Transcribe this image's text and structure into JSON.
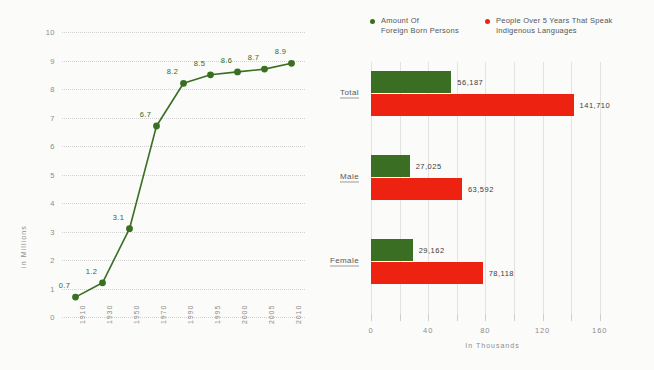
{
  "colors": {
    "green": "#3a6f23",
    "red": "#ee2211",
    "grid": "#d2d2d2",
    "text": "#8b8b8d"
  },
  "chart_data": [
    {
      "type": "line",
      "name": "foreign-born-line-chart",
      "title": "",
      "xlabel": "",
      "ylabel": "in Millions",
      "ylim": [
        0,
        10
      ],
      "yticks": [
        "0",
        "1",
        "2",
        "3",
        "4",
        "5",
        "6",
        "7",
        "8",
        "9",
        "10"
      ],
      "grid": true,
      "categories": [
        "1910",
        "1930",
        "1950",
        "1970",
        "1990",
        "1995",
        "2000",
        "2005",
        "2010"
      ],
      "values": [
        0.7,
        1.2,
        3.1,
        6.7,
        8.2,
        8.5,
        8.6,
        8.7,
        8.9
      ],
      "point_labels": [
        "0.7",
        "1.2",
        "3.1",
        "6.7",
        "8.2",
        "8.5",
        "8.6",
        "8.7",
        "8.9"
      ],
      "series_color": "#3a6f23"
    },
    {
      "type": "bar",
      "name": "population-bar-chart",
      "orientation": "horizontal",
      "xlabel": "In Thousands",
      "ylabel": "",
      "xlim": [
        0,
        170
      ],
      "xticks": [
        0,
        20,
        40,
        60,
        80,
        100,
        120,
        140,
        160
      ],
      "xtick_labels": [
        {
          "value": 0,
          "label": "0"
        },
        {
          "value": 40,
          "label": "40"
        },
        {
          "value": 80,
          "label": "80"
        },
        {
          "value": 120,
          "label": "120"
        },
        {
          "value": 160,
          "label": "160"
        }
      ],
      "grid": true,
      "categories": [
        "Total",
        "Male",
        "Female"
      ],
      "series": [
        {
          "name": "Amount Of Foreign Born Persons",
          "color": "#3a6f23",
          "values": [
            56.187,
            27.025,
            29.162
          ],
          "labels": [
            "56,187",
            "27,025",
            "29,162"
          ]
        },
        {
          "name": "People Over 5 Years That Speak Indigenous Languages",
          "color": "#ee2211",
          "values": [
            141.71,
            63.592,
            78.118
          ],
          "labels": [
            "141,710",
            "63,592",
            "78,118"
          ]
        }
      ],
      "legend": [
        {
          "label_line1": "Amount Of",
          "label_line2": "Foreign Born Persons",
          "color": "#3a6f23"
        },
        {
          "label_line1": "People Over 5 Years That Speak",
          "label_line2": "Indigenous Languages",
          "color": "#ee2211"
        }
      ]
    }
  ]
}
